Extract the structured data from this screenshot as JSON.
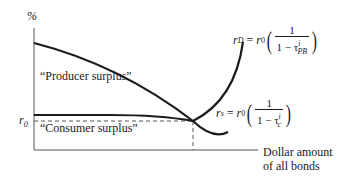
{
  "diagram": {
    "y_axis_label": "%",
    "x_axis_label_line1": "Dollar amount",
    "x_axis_label_line2": "of all bonds",
    "r0_label": "r",
    "r0_sub": "0",
    "producer_surplus_label": "“Producer surplus”",
    "consumer_surplus_label": "“Consumer surplus”",
    "demand_curve": {
      "lhs_var": "r",
      "lhs_sub": "D",
      "rhs_var": "r",
      "rhs_sub": "0",
      "numerator": "1",
      "denominator_prefix": "1 − τ",
      "tau_sup": "i",
      "tau_sub": "PB"
    },
    "supply_curve": {
      "lhs_var": "r",
      "lhs_sub": "s",
      "rhs_var": "r",
      "rhs_sub": "0",
      "numerator": "1",
      "denominator_prefix": "1 − τ",
      "tau_sup": "i",
      "tau_sub": "c"
    },
    "colors": {
      "line": "#1a1a1a",
      "dashed": "#555555",
      "background": "#ffffff"
    }
  }
}
